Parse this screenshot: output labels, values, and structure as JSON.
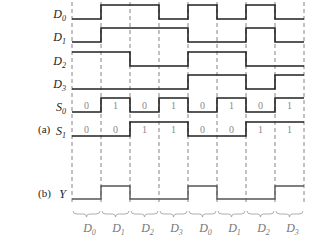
{
  "diagram": {
    "panel_labels": {
      "a": "(a)",
      "b": "(b)"
    },
    "grid_x": [
      72,
      101,
      130,
      159,
      188,
      217,
      246,
      275,
      304
    ],
    "signals": [
      {
        "name": "D",
        "sub": "0",
        "values": [
          0,
          1,
          1,
          0,
          1,
          0,
          1,
          0
        ],
        "y_high": 5,
        "y_low": 19
      },
      {
        "name": "D",
        "sub": "1",
        "values": [
          0,
          1,
          1,
          1,
          0,
          0,
          1,
          0
        ],
        "y_high": 28,
        "y_low": 42
      },
      {
        "name": "D",
        "sub": "2",
        "values": [
          1,
          1,
          0,
          0,
          1,
          1,
          0,
          0
        ],
        "y_high": 52,
        "y_low": 66
      },
      {
        "name": "D",
        "sub": "3",
        "values": [
          0,
          0,
          0,
          0,
          1,
          1,
          0,
          1
        ],
        "y_high": 75,
        "y_low": 89
      },
      {
        "name": "S",
        "sub": "0",
        "values": [
          0,
          1,
          0,
          1,
          0,
          1,
          0,
          1
        ],
        "y_high": 98,
        "y_low": 112,
        "show_values": true
      },
      {
        "name": "S",
        "sub": "1",
        "values": [
          0,
          0,
          1,
          1,
          0,
          0,
          1,
          1
        ],
        "y_high": 122,
        "y_low": 136,
        "show_values": true
      }
    ],
    "output": {
      "name": "Y",
      "values": [
        0,
        1,
        0,
        0,
        1,
        0,
        0,
        1
      ],
      "y_high": 186,
      "y_low": 199
    },
    "selected_inputs": [
      {
        "name": "D",
        "sub": "0"
      },
      {
        "name": "D",
        "sub": "1"
      },
      {
        "name": "D",
        "sub": "2"
      },
      {
        "name": "D",
        "sub": "3"
      },
      {
        "name": "D",
        "sub": "0"
      },
      {
        "name": "D",
        "sub": "1"
      },
      {
        "name": "D",
        "sub": "2"
      },
      {
        "name": "D",
        "sub": "3"
      }
    ],
    "colors": {
      "signal": "#222222",
      "output": "#555555",
      "grid": "#666666",
      "value_text": "#888888",
      "brace": "#999999"
    }
  }
}
